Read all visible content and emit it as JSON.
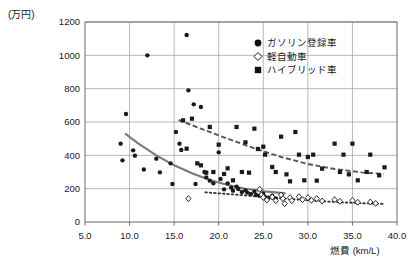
{
  "chart_data": {
    "type": "scatter",
    "title": "",
    "xlabel": "燃費 (km/L)",
    "ylabel": "(万円)",
    "xlim": [
      5.0,
      40.0
    ],
    "ylim": [
      0,
      1200
    ],
    "xticks": [
      "5.0",
      "10.0",
      "15.0",
      "20.0",
      "25.0",
      "30.0",
      "35.0",
      "40.0"
    ],
    "xtick_values": [
      5,
      10,
      15,
      20,
      25,
      30,
      35,
      40
    ],
    "yticks": [
      "0",
      "200",
      "400",
      "600",
      "800",
      "1000",
      "1200"
    ],
    "ytick_values": [
      0,
      200,
      400,
      600,
      800,
      1000,
      1200
    ],
    "grid": true,
    "legend_position": "top-right",
    "legend": [
      {
        "marker": "filled-circle",
        "label": "ガソリン登録車"
      },
      {
        "marker": "open-diamond",
        "label": "軽自動車"
      },
      {
        "marker": "filled-square",
        "label": "ハイブリッド車"
      }
    ],
    "series": [
      {
        "name": "ガソリン登録車",
        "marker": "filled-circle",
        "color": "#1a1a1a",
        "points": [
          [
            9.0,
            470
          ],
          [
            9.2,
            370
          ],
          [
            9.6,
            648
          ],
          [
            10.4,
            430
          ],
          [
            10.6,
            398
          ],
          [
            11.6,
            315
          ],
          [
            12.0,
            1000
          ],
          [
            13.0,
            380
          ],
          [
            13.4,
            298
          ],
          [
            14.6,
            352
          ],
          [
            14.8,
            228
          ],
          [
            15.2,
            540
          ],
          [
            15.6,
            470
          ],
          [
            15.8,
            432
          ],
          [
            16.4,
            1122
          ],
          [
            16.6,
            790
          ],
          [
            17.2,
            706
          ],
          [
            17.4,
            228
          ],
          [
            18.0,
            690
          ],
          [
            18.4,
            300
          ],
          [
            18.6,
            268
          ],
          [
            19.0,
            248
          ],
          [
            19.4,
            232
          ],
          [
            20.0,
            418
          ],
          [
            20.2,
            258
          ],
          [
            20.6,
            196
          ],
          [
            21.0,
            232
          ],
          [
            21.4,
            206
          ],
          [
            21.6,
            188
          ],
          [
            22.0,
            212
          ],
          [
            22.2,
            198
          ],
          [
            22.6,
            180
          ],
          [
            23.0,
            190
          ],
          [
            23.2,
            176
          ],
          [
            23.6,
            168
          ],
          [
            24.0,
            182
          ],
          [
            24.2,
            162
          ],
          [
            24.6,
            158
          ],
          [
            25.0,
            170
          ],
          [
            25.2,
            150
          ],
          [
            25.6,
            146
          ],
          [
            26.0,
            158
          ],
          [
            26.4,
            142
          ]
        ]
      },
      {
        "name": "軽自動車",
        "marker": "open-diamond",
        "color": "#1a1a1a",
        "points": [
          [
            16.6,
            140
          ],
          [
            24.6,
            196
          ],
          [
            24.8,
            162
          ],
          [
            25.0,
            148
          ],
          [
            25.4,
            132
          ],
          [
            26.0,
            150
          ],
          [
            26.4,
            128
          ],
          [
            27.0,
            162
          ],
          [
            27.2,
            140
          ],
          [
            27.4,
            110
          ],
          [
            28.0,
            146
          ],
          [
            28.2,
            128
          ],
          [
            29.0,
            152
          ],
          [
            29.4,
            134
          ],
          [
            30.0,
            146
          ],
          [
            30.4,
            130
          ],
          [
            31.0,
            140
          ],
          [
            31.6,
            126
          ],
          [
            33.0,
            134
          ],
          [
            33.6,
            124
          ],
          [
            35.0,
            130
          ],
          [
            35.6,
            118
          ],
          [
            37.0,
            120
          ],
          [
            37.6,
            112
          ]
        ]
      },
      {
        "name": "ハイブリッド車",
        "marker": "filled-square",
        "color": "#1a1a1a",
        "points": [
          [
            16.0,
            610
          ],
          [
            16.4,
            440
          ],
          [
            17.0,
            620
          ],
          [
            17.6,
            352
          ],
          [
            18.0,
            340
          ],
          [
            18.6,
            296
          ],
          [
            19.0,
            570
          ],
          [
            19.4,
            300
          ],
          [
            20.0,
            464
          ],
          [
            20.6,
            288
          ],
          [
            21.0,
            322
          ],
          [
            21.6,
            250
          ],
          [
            22.0,
            570
          ],
          [
            22.6,
            300
          ],
          [
            23.0,
            478
          ],
          [
            23.4,
            296
          ],
          [
            24.0,
            560
          ],
          [
            24.4,
            438
          ],
          [
            25.0,
            452
          ],
          [
            25.2,
            404
          ],
          [
            26.0,
            330
          ],
          [
            26.4,
            300
          ],
          [
            27.0,
            512
          ],
          [
            27.6,
            286
          ],
          [
            28.0,
            244
          ],
          [
            28.6,
            540
          ],
          [
            29.0,
            404
          ],
          [
            29.6,
            250
          ],
          [
            30.0,
            390
          ],
          [
            30.6,
            404
          ],
          [
            31.0,
            248
          ],
          [
            31.6,
            320
          ],
          [
            33.0,
            470
          ],
          [
            33.6,
            300
          ],
          [
            34.0,
            404
          ],
          [
            34.6,
            286
          ],
          [
            35.0,
            470
          ],
          [
            35.6,
            250
          ],
          [
            36.6,
            300
          ],
          [
            37.0,
            404
          ],
          [
            38.0,
            280
          ],
          [
            38.6,
            328
          ]
        ]
      }
    ],
    "trendlines": [
      {
        "name": "ガソリン登録車",
        "style": "solid",
        "color": "#7a7a7a",
        "points": [
          [
            9.5,
            530
          ],
          [
            11,
            470
          ],
          [
            13,
            400
          ],
          [
            15,
            340
          ],
          [
            17,
            292
          ],
          [
            19,
            252
          ],
          [
            21,
            222
          ],
          [
            23,
            200
          ],
          [
            25.5,
            182
          ],
          [
            27.5,
            172
          ]
        ]
      },
      {
        "name": "ハイブリッド車",
        "style": "dashed",
        "color": "#555555",
        "points": [
          [
            15.5,
            612
          ],
          [
            18,
            560
          ],
          [
            21,
            500
          ],
          [
            24,
            442
          ],
          [
            27,
            390
          ],
          [
            30,
            348
          ],
          [
            33,
            318
          ],
          [
            36,
            298
          ],
          [
            38.5,
            288
          ]
        ]
      },
      {
        "name": "軽自動車",
        "style": "dotted",
        "color": "#333333",
        "points": [
          [
            18.5,
            178
          ],
          [
            21,
            168
          ],
          [
            24,
            155
          ],
          [
            27,
            142
          ],
          [
            30,
            130
          ],
          [
            33,
            120
          ],
          [
            36,
            113
          ],
          [
            38.5,
            108
          ]
        ]
      }
    ]
  }
}
